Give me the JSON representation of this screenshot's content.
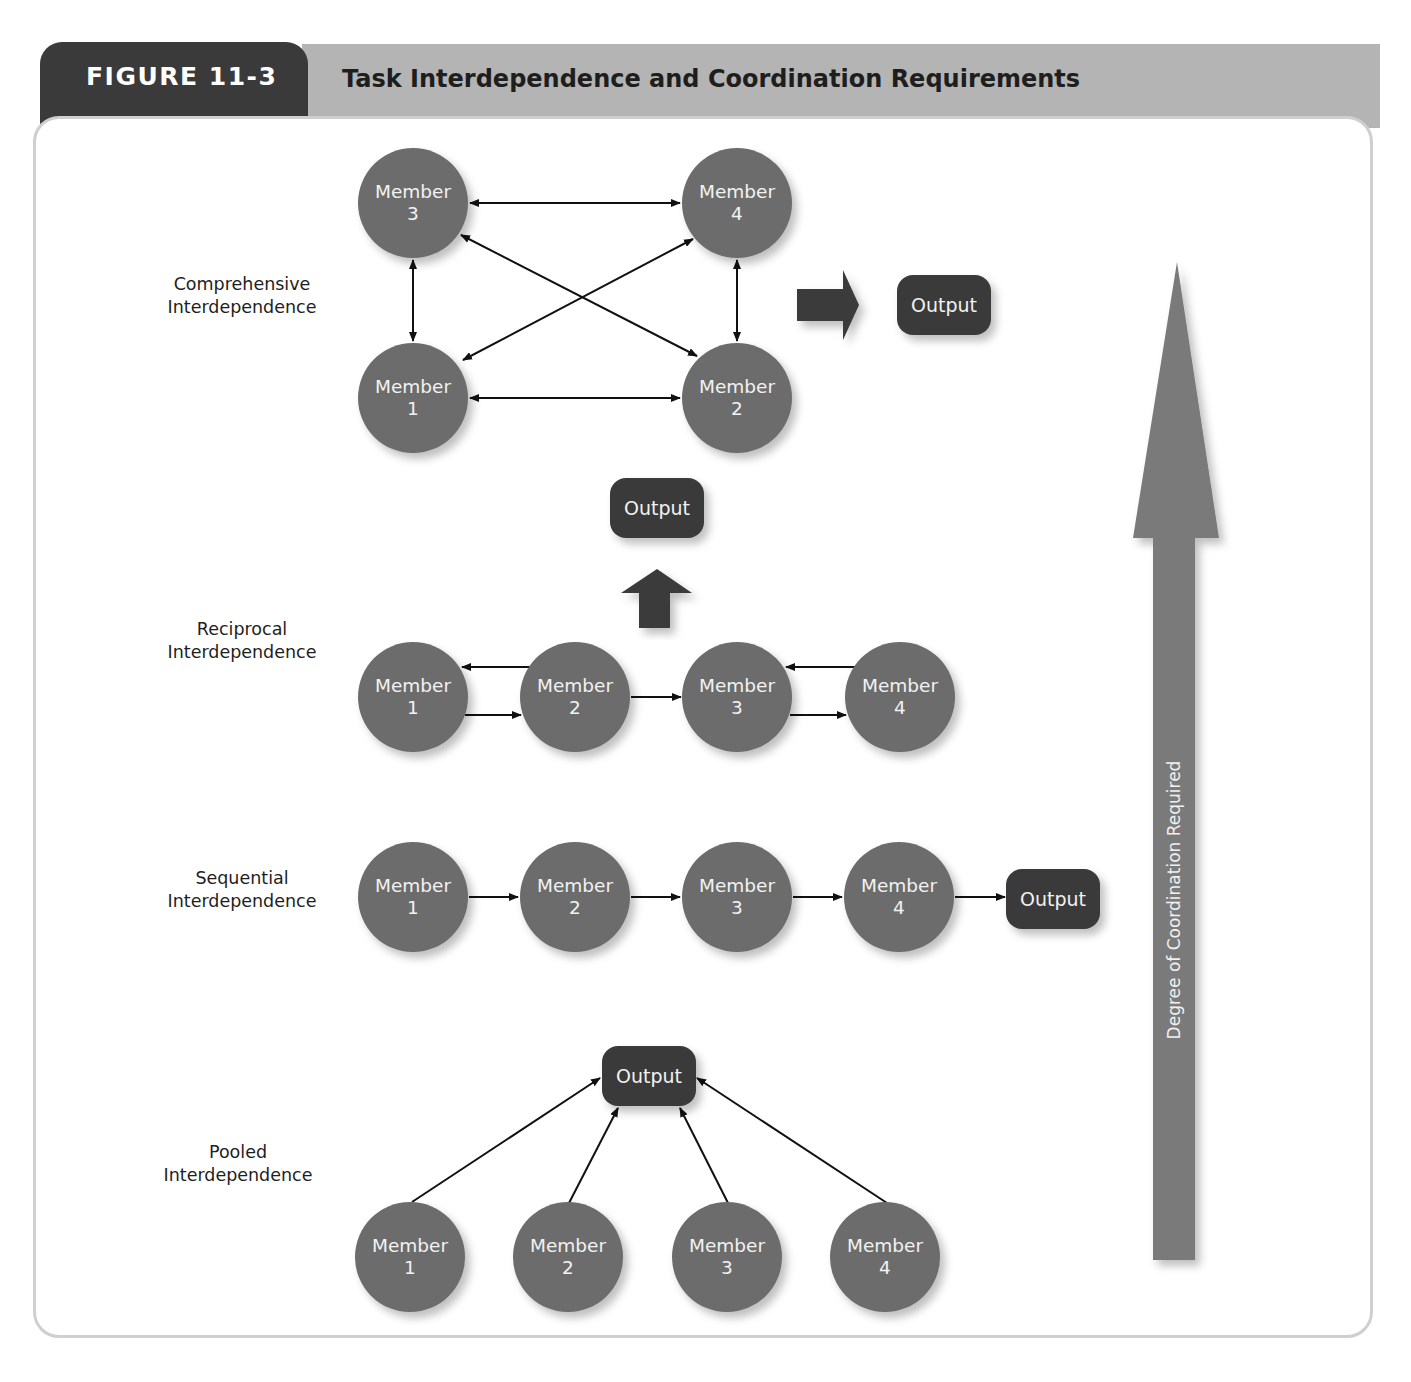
{
  "figure": {
    "number_label": "FIGURE 11-3",
    "title": "Task Interdependence and Coordination Requirements"
  },
  "colors": {
    "tab_dark": "#3a3a3a",
    "title_band": "#b4b4b4",
    "member_circle": "#6c6c6c",
    "output_box": "#3a3a3a",
    "coordination_arrow": "#7a7a7a",
    "connector": "#111111",
    "panel_border": "#cfcfcf"
  },
  "axis": {
    "label": "Degree of Coordination Required",
    "direction": "up"
  },
  "rows": {
    "comprehensive": {
      "label_line1": "Comprehensive",
      "label_line2": "Interdependence",
      "members": [
        {
          "word": "Member",
          "number": "3"
        },
        {
          "word": "Member",
          "number": "4"
        },
        {
          "word": "Member",
          "number": "1"
        },
        {
          "word": "Member",
          "number": "2"
        }
      ],
      "output": "Output",
      "links": [
        "3<->4",
        "1<->2",
        "3<->1",
        "4<->2",
        "3<->2",
        "4<->1"
      ]
    },
    "reciprocal": {
      "label_line1": "Reciprocal",
      "label_line2": "Interdependence",
      "members": [
        {
          "word": "Member",
          "number": "1"
        },
        {
          "word": "Member",
          "number": "2"
        },
        {
          "word": "Member",
          "number": "3"
        },
        {
          "word": "Member",
          "number": "4"
        }
      ],
      "output": "Output",
      "links": [
        "2->1",
        "1->2",
        "2->3",
        "4->3",
        "3->4"
      ]
    },
    "sequential": {
      "label_line1": "Sequential",
      "label_line2": "Interdependence",
      "members": [
        {
          "word": "Member",
          "number": "1"
        },
        {
          "word": "Member",
          "number": "2"
        },
        {
          "word": "Member",
          "number": "3"
        },
        {
          "word": "Member",
          "number": "4"
        }
      ],
      "output": "Output",
      "links": [
        "1->2",
        "2->3",
        "3->4",
        "4->Output"
      ]
    },
    "pooled": {
      "label_line1": "Pooled",
      "label_line2": "Interdependence",
      "members": [
        {
          "word": "Member",
          "number": "1"
        },
        {
          "word": "Member",
          "number": "2"
        },
        {
          "word": "Member",
          "number": "3"
        },
        {
          "word": "Member",
          "number": "4"
        }
      ],
      "output": "Output",
      "links": [
        "1->Output",
        "2->Output",
        "3->Output",
        "4->Output"
      ]
    }
  }
}
